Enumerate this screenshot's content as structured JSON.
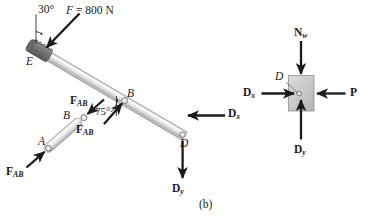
{
  "figure": {
    "caption": "(b)",
    "type": "free-body-diagram"
  },
  "beam_fbd": {
    "applied_force": {
      "label_F": "F",
      "label_eq": " = 800 N",
      "angle": "30°"
    },
    "joint_E": "E",
    "joint_B": "B",
    "joint_D": "D",
    "angle_at_B": "75°",
    "force_AB_at_B": "F",
    "force_AB_at_B_sub": "AB",
    "reaction_Dx": "D",
    "reaction_Dx_sub": "x",
    "reaction_Dy": "D",
    "reaction_Dy_sub": "y"
  },
  "member_ab_fbd": {
    "joint_A": "A",
    "joint_B": "B",
    "force_top": "F",
    "force_top_sub": "AB",
    "force_bottom": "F",
    "force_bottom_sub": "AB"
  },
  "block_fbd": {
    "pin_label": "D",
    "normal_force": "N",
    "normal_force_sub": "w",
    "force_Dx": "D",
    "force_Dx_sub": "x",
    "force_Dy": "D",
    "force_Dy_sub": "y",
    "force_P": "P"
  },
  "colors": {
    "ink": "#1a1a1a",
    "beam_light": "#f2f2f2",
    "beam_mid": "#d4d4d4",
    "beam_dark": "#9a9a9a",
    "grip_dark": "#6e6e6e",
    "block_fill": "#c8c8c8",
    "block_stroke": "#7a7a7a"
  }
}
